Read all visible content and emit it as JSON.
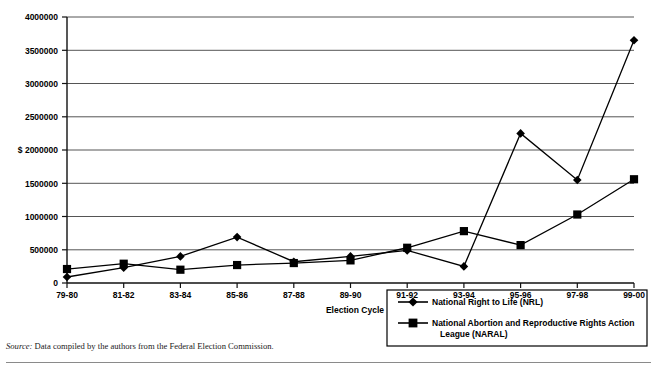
{
  "chart_data": {
    "type": "line",
    "title": "",
    "xlabel": "Election Cycle",
    "ylabel": "$",
    "ylim": [
      0,
      4000000
    ],
    "ytick_values": [
      0,
      500000,
      1000000,
      1500000,
      2000000,
      2500000,
      3000000,
      3500000,
      4000000
    ],
    "ytick_labels": [
      "0",
      "500000",
      "1000000",
      "1500000",
      "2000000",
      "$ 2000000",
      "2500000",
      "3000000",
      "3500000",
      "4000000"
    ],
    "grid": true,
    "legend_position": "bottom-right",
    "categories": [
      "79-80",
      "81-82",
      "83-84",
      "85-86",
      "87-88",
      "89-90",
      "91-92",
      "93-94",
      "95-96",
      "97-98",
      "99-00"
    ],
    "series": [
      {
        "name": "National Right to Life (NRL)",
        "marker": "diamond",
        "values": [
          90000,
          230000,
          400000,
          690000,
          320000,
          400000,
          490000,
          250000,
          2250000,
          1550000,
          3650000
        ]
      },
      {
        "name": "National Abortion and Reproductive Rights Action League (NARAL)",
        "marker": "square",
        "values": [
          210000,
          290000,
          200000,
          270000,
          300000,
          340000,
          530000,
          780000,
          570000,
          1030000,
          1560000
        ]
      }
    ]
  },
  "axes": {
    "y_labels": [
      "4000000",
      "3500000",
      "3000000",
      "2500000",
      "$ 2000000",
      "1500000",
      "1000000",
      "500000",
      "0"
    ],
    "x_labels": [
      "79-80",
      "81-82",
      "83-84",
      "85-86",
      "87-88",
      "89-90",
      "91-92",
      "93-94",
      "95-96",
      "97-98",
      "99-00"
    ],
    "x_axis_title": "Election Cycle"
  },
  "legend": {
    "entries": [
      {
        "label": "National Right to Life (NRL)",
        "marker": "diamond-marker"
      },
      {
        "label": "National Abortion and Reproductive Rights Action",
        "label2": "League (NARAL)",
        "marker": "square-marker"
      }
    ]
  },
  "source_note": {
    "prefix": "Source:",
    "text": "Data compiled by the authors from the Federal Election Commission."
  },
  "colors": {
    "series": "#000000",
    "grid": "#555555",
    "axis": "#111111",
    "background": "#ffffff"
  }
}
